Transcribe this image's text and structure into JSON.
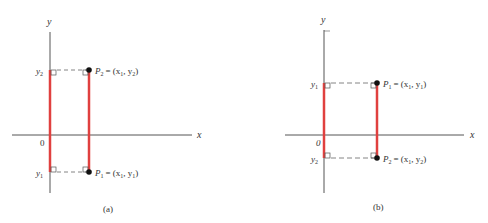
{
  "colors": {
    "axis": "#555555",
    "segment": "#e0403f",
    "point": "#111111",
    "dash": "#666666",
    "text": "#333333"
  },
  "panels": [
    {
      "caption": "(a)",
      "x_axis_label": "x",
      "y_axis_label": "y",
      "origin_label": "0",
      "upper_tick_label": "y",
      "upper_tick_sub": "2",
      "lower_tick_label": "y",
      "lower_tick_sub": "1",
      "upper_point": {
        "name": "P",
        "sub": "2",
        "coords": "= (x",
        "c1sub": "1",
        "sep": ", y",
        "c2sub": "2",
        "close": ")"
      },
      "lower_point": {
        "name": "P",
        "sub": "1",
        "coords": "= (x",
        "c1sub": "1",
        "sep": ", y",
        "c2sub": "1",
        "close": ")"
      }
    },
    {
      "caption": "(b)",
      "x_axis_label": "x",
      "y_axis_label": "y",
      "origin_label": "0",
      "upper_tick_label": "y",
      "upper_tick_sub": "1",
      "lower_tick_label": "y",
      "lower_tick_sub": "2",
      "upper_point": {
        "name": "P",
        "sub": "1",
        "coords": "= (x",
        "c1sub": "1",
        "sep": ", y",
        "c2sub": "1",
        "close": ")"
      },
      "lower_point": {
        "name": "P",
        "sub": "2",
        "coords": "= (x",
        "c1sub": "1",
        "sep": ", y",
        "c2sub": "2",
        "close": ")"
      }
    }
  ]
}
